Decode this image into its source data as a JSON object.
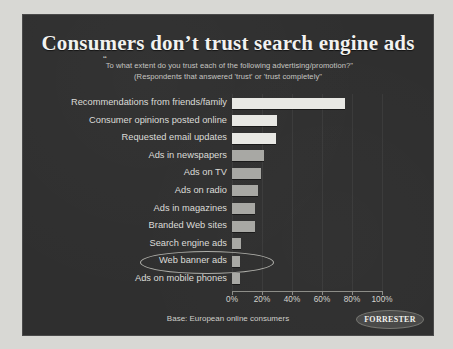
{
  "slide": {
    "title": "Consumers don’t trust search engine ads",
    "subtitle_line1": "To what extent do you trust each of the following advertising/promotion?\"",
    "subtitle_line2": "(Respondents that answered 'trust' or 'trust completely\"",
    "open_quote": "“",
    "footer_base": "Base: European online consumers",
    "logo_text": "FORRESTER",
    "background_color": "#2f2f2f",
    "title_color": "#f2f2f0",
    "bar_color_light": "#e8e8e4",
    "bar_color_mid": "#a8a8a4",
    "highlight_label": "Search engine ads"
  },
  "chart_data": {
    "type": "bar",
    "orientation": "horizontal",
    "title": "Consumers don’t trust search engine ads",
    "subtitle": "“To what extent do you trust each of the following advertising/promotion?\" (Respondents that answered 'trust' or 'trust completely\"",
    "xlabel": "",
    "ylabel": "",
    "xlim": [
      0,
      100
    ],
    "grid": true,
    "legend": false,
    "tick_labels": [
      "0%",
      "20%",
      "40%",
      "60%",
      "80%",
      "100%"
    ],
    "tick_values": [
      0,
      20,
      40,
      60,
      80,
      100
    ],
    "categories": [
      "Recommendations from friends/family",
      "Consumer opinions posted online",
      "Requested email updates",
      "Ads in newspapers",
      "Ads on TV",
      "Ads on radio",
      "Ads in magazines",
      "Branded Web sites",
      "Search engine ads",
      "Web banner ads",
      "Ads on mobile phones"
    ],
    "values": [
      75,
      30,
      29,
      21,
      19,
      17,
      15,
      15,
      6,
      5,
      5
    ],
    "bar_shades": [
      "light",
      "light",
      "light",
      "mid",
      "mid",
      "mid",
      "mid",
      "mid",
      "mid",
      "mid",
      "mid"
    ],
    "annotations": [
      {
        "type": "ellipse-highlight",
        "target": "Search engine ads"
      }
    ],
    "source_note": "Base: European online consumers"
  }
}
